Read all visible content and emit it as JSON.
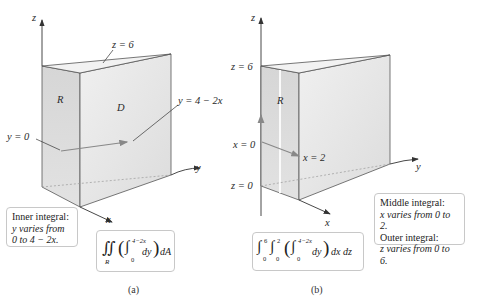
{
  "panel_a": {
    "axis_labels": {
      "z": "z",
      "y": "y",
      "x": "x"
    },
    "top_label": "z = 6",
    "face_labels": {
      "R": "R",
      "D": "D"
    },
    "curve_label": "y = 4 − 2x",
    "start_label": "y = 0",
    "note": {
      "line1": "Inner integral:",
      "line2": "y varies from",
      "line3": "0 to 4 − 2x."
    },
    "formula": {
      "outer": "∬",
      "outer_sub": "R",
      "inner_int": "∫",
      "inner_upper": "4−2x",
      "inner_lower": "0",
      "inner_body": "dy",
      "tail": "dA"
    },
    "caption": "(a)"
  },
  "panel_b": {
    "axis_labels": {
      "z": "z",
      "y": "y",
      "x": "x"
    },
    "z_top_label": "z = 6",
    "z_bottom_label": "z = 0",
    "x_start_label": "x = 0",
    "x_end_label": "x = 2",
    "face_labels": {
      "R": "R"
    },
    "note": {
      "line1": "Middle integral:",
      "line2": "x varies from 0 to 2.",
      "line3": "Outer integral:",
      "line4": "z varies from 0 to 6."
    },
    "formula": {
      "int1_upper": "6",
      "int1_lower": "0",
      "int2_upper": "2",
      "int2_lower": "0",
      "inner_upper": "4−2x",
      "inner_lower": "0",
      "inner_body": "dy",
      "tail": "dx dz"
    },
    "caption": "(b)"
  },
  "colors": {
    "face_front": "#e6e6e6",
    "face_side": "#d2d2d2",
    "face_top": "#efefef",
    "edge": "#555555",
    "arrow": "#777777",
    "box_border": "#c8c8c8"
  }
}
